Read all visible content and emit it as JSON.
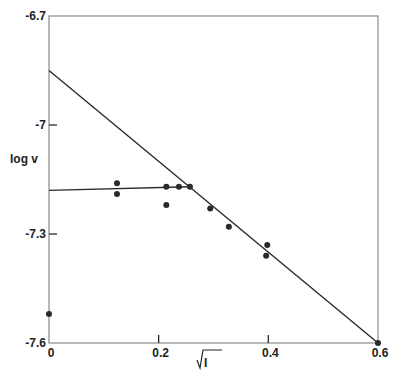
{
  "chart_data": {
    "type": "scatter",
    "title": "",
    "xlabel": "√I",
    "ylabel": "log v",
    "xlim": [
      0,
      0.6
    ],
    "ylim": [
      -7.6,
      -6.7
    ],
    "grid": false,
    "legend": null,
    "x_ticks": [
      {
        "value": 0,
        "label": "0"
      },
      {
        "value": 0.2,
        "label": "0.2"
      },
      {
        "value": 0.4,
        "label": "0.4"
      },
      {
        "value": 0.6,
        "label": "0.6"
      }
    ],
    "y_ticks": [
      {
        "value": -6.7,
        "label": "-6.7"
      },
      {
        "value": -7.0,
        "label": "-7"
      },
      {
        "value": -7.3,
        "label": "-7.3"
      },
      {
        "value": -7.6,
        "label": "-7.6"
      }
    ],
    "series": [
      {
        "name": "measured",
        "kind": "points",
        "points": [
          {
            "x": 0.0,
            "y": -7.52
          },
          {
            "x": 0.124,
            "y": -7.16
          },
          {
            "x": 0.124,
            "y": -7.19
          },
          {
            "x": 0.214,
            "y": -7.17
          },
          {
            "x": 0.214,
            "y": -7.22
          },
          {
            "x": 0.237,
            "y": -7.17
          },
          {
            "x": 0.257,
            "y": -7.17
          },
          {
            "x": 0.294,
            "y": -7.23
          },
          {
            "x": 0.328,
            "y": -7.28
          },
          {
            "x": 0.398,
            "y": -7.33
          },
          {
            "x": 0.396,
            "y": -7.36
          },
          {
            "x": 0.6,
            "y": -7.6
          }
        ]
      },
      {
        "name": "linear fit (steep)",
        "kind": "line",
        "points": [
          {
            "x": 0.0,
            "y": -6.85
          },
          {
            "x": 0.6,
            "y": -7.6
          }
        ]
      },
      {
        "name": "plateau fit",
        "kind": "line",
        "points": [
          {
            "x": 0.0,
            "y": -7.18
          },
          {
            "x": 0.257,
            "y": -7.17
          }
        ]
      }
    ],
    "colors": {
      "ink": "#2a2a2a",
      "frame": "#8a8a8a",
      "background": "#ffffff"
    }
  }
}
